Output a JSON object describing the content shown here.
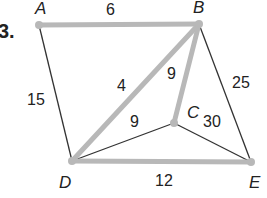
{
  "problem_number": "3.",
  "graph": {
    "vertices": [
      {
        "id": "A",
        "x": 39,
        "y": 25
      },
      {
        "id": "B",
        "x": 199,
        "y": 24
      },
      {
        "id": "C",
        "x": 174,
        "y": 123
      },
      {
        "id": "D",
        "x": 72,
        "y": 161
      },
      {
        "id": "E",
        "x": 251,
        "y": 162
      }
    ],
    "edges": [
      {
        "from": "A",
        "to": "B",
        "weight": "6",
        "highlighted": true
      },
      {
        "from": "A",
        "to": "D",
        "weight": "15",
        "highlighted": false
      },
      {
        "from": "B",
        "to": "D",
        "weight": "4",
        "highlighted": true
      },
      {
        "from": "B",
        "to": "C",
        "weight": "9",
        "highlighted": true
      },
      {
        "from": "B",
        "to": "E",
        "weight": "25",
        "highlighted": false
      },
      {
        "from": "C",
        "to": "D",
        "weight": "9",
        "highlighted": false
      },
      {
        "from": "C",
        "to": "E",
        "weight": "30",
        "highlighted": false
      },
      {
        "from": "D",
        "to": "E",
        "weight": "12",
        "highlighted": true
      }
    ]
  },
  "colors": {
    "highlight": "#b8b8b8",
    "edge": "#333333",
    "text": "#222222"
  }
}
